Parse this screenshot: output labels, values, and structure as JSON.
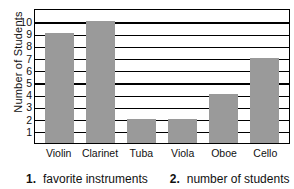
{
  "chart_data": {
    "type": "bar",
    "title": "",
    "xlabel": "",
    "ylabel": "Number of Students",
    "categories": [
      "Violin",
      "Clarinet",
      "Tuba",
      "Viola",
      "Oboe",
      "Cello"
    ],
    "values": [
      9,
      10,
      2,
      2,
      4,
      7
    ],
    "ylim": [
      0,
      11
    ],
    "yticks": [
      10,
      9,
      8,
      7,
      6,
      5,
      4,
      3,
      2,
      1
    ],
    "ytick_labels": [
      "10",
      "9",
      "8",
      "7",
      "6",
      "5",
      "4",
      "3",
      "2",
      "1"
    ],
    "grid": true,
    "grid_orientation": "horizontal",
    "legend": "none",
    "bar_color": "#9a9a9a",
    "frame_color": "#000000"
  },
  "caption": {
    "items": [
      {
        "number": "1.",
        "text": "favorite instruments"
      },
      {
        "number": "2.",
        "text": "number of students"
      }
    ]
  }
}
